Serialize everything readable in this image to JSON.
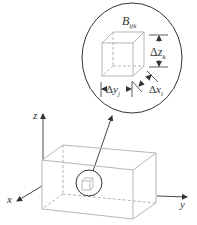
{
  "figure": {
    "block_label": {
      "main": "B",
      "sub": "ijk"
    },
    "dimensions": {
      "dz": {
        "delta": "Δ",
        "var": "z",
        "sub": "k"
      },
      "dy": {
        "delta": "Δ",
        "var": "y",
        "sub": "j"
      },
      "dx": {
        "delta": "Δ",
        "var": "x",
        "sub": "i"
      }
    },
    "axes": {
      "x": "x",
      "y": "y",
      "z": "z"
    },
    "colors": {
      "ink": "#333333",
      "box_lines": "#b5b5b5"
    }
  }
}
